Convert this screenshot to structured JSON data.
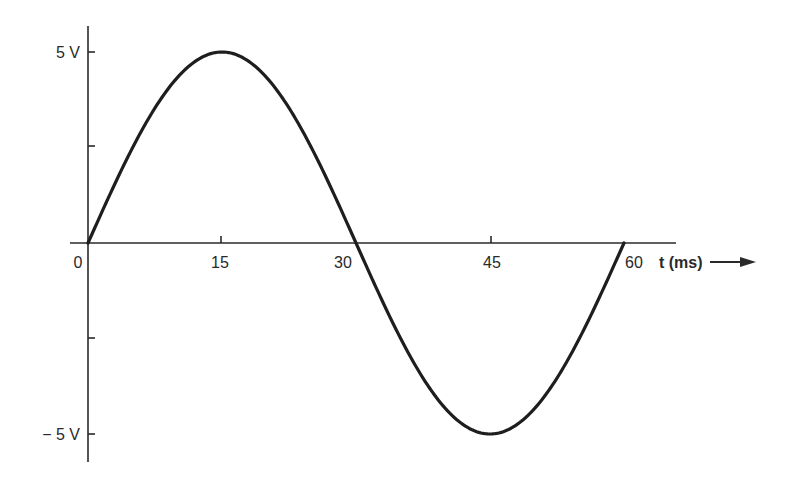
{
  "chart_data": {
    "type": "line",
    "title": "",
    "xlabel": "t (ms)",
    "ylabel": "",
    "x_ticks": [
      "0",
      "15",
      "30",
      "45",
      "60"
    ],
    "y_ticks": [
      "5 V",
      "",
      "",
      "",
      "− 5 V"
    ],
    "xlim": [
      0,
      60
    ],
    "ylim": [
      -5,
      5
    ],
    "grid": false,
    "legend": null,
    "series": [
      {
        "name": "sine wave",
        "amplitude_v": 5,
        "period_ms": 60,
        "x": [
          0,
          7.5,
          15,
          22.5,
          30,
          37.5,
          45,
          52.5,
          60
        ],
        "values": [
          0,
          3.54,
          5,
          3.54,
          0,
          -3.54,
          -5,
          -3.54,
          0
        ]
      }
    ]
  },
  "axes": {
    "y_top_label": "5 V",
    "y_bottom_label": "− 5 V",
    "x_tick_labels": [
      "0",
      "15",
      "30",
      "45",
      "60"
    ],
    "x_axis_label": "t (ms)"
  }
}
